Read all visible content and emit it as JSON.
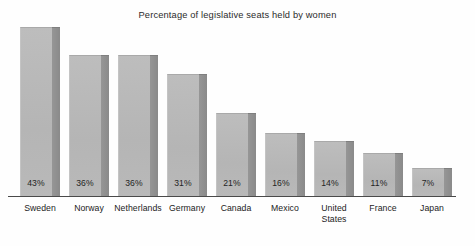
{
  "chart_data": {
    "type": "bar",
    "title": "Percentage of legislative seats held by women",
    "xlabel": "",
    "ylabel": "",
    "ylim": [
      0,
      50
    ],
    "grid": false,
    "legend": "none",
    "categories": [
      "Sweden",
      "Norway",
      "Netherlands",
      "Germany",
      "Canada",
      "Mexico",
      "United States",
      "France",
      "Japan"
    ],
    "values": [
      43,
      36,
      36,
      31,
      21,
      16,
      14,
      11,
      7
    ],
    "value_labels": [
      "43%",
      "36%",
      "36%",
      "31%",
      "21%",
      "16%",
      "14%",
      "11%",
      "7%"
    ],
    "series": [
      {
        "name": "Percentage of legislative seats held by women",
        "values": [
          43,
          36,
          36,
          31,
          21,
          16,
          14,
          11,
          7
        ]
      }
    ],
    "bars": [
      {
        "category": "Sweden",
        "label_lines": [
          "Sweden"
        ],
        "value": 43,
        "value_label": "43%",
        "x": 20,
        "width": 40
      },
      {
        "category": "Norway",
        "label_lines": [
          "Norway"
        ],
        "value": 36,
        "value_label": "36%",
        "x": 69,
        "width": 40
      },
      {
        "category": "Netherlands",
        "label_lines": [
          "Netherlands"
        ],
        "value": 36,
        "value_label": "36%",
        "x": 118,
        "width": 40
      },
      {
        "category": "Germany",
        "label_lines": [
          "Germany"
        ],
        "value": 31,
        "value_label": "31%",
        "x": 167,
        "width": 40
      },
      {
        "category": "Canada",
        "label_lines": [
          "Canada"
        ],
        "value": 21,
        "value_label": "21%",
        "x": 216,
        "width": 40
      },
      {
        "category": "Mexico",
        "label_lines": [
          "Mexico"
        ],
        "value": 16,
        "value_label": "16%",
        "x": 265,
        "width": 40
      },
      {
        "category": "United States",
        "label_lines": [
          "United",
          "States"
        ],
        "value": 14,
        "value_label": "14%",
        "x": 314,
        "width": 40
      },
      {
        "category": "France",
        "label_lines": [
          "France"
        ],
        "value": 11,
        "value_label": "11%",
        "x": 363,
        "width": 40
      },
      {
        "category": "Japan",
        "label_lines": [
          "Japan"
        ],
        "value": 7,
        "value_label": "7%",
        "x": 412,
        "width": 40
      }
    ],
    "colors": {
      "bar_face": "#b9b9b9",
      "bar_side": "#8e8e8e",
      "axis": "#4a4a4a",
      "text": "#232323",
      "background": "#fefefe"
    }
  }
}
